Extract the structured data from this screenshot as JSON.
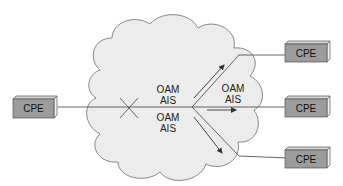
{
  "diagram": {
    "type": "network-fault-propagation",
    "cloud": {
      "fill": "#ececec",
      "stroke": "#7a7a7a"
    },
    "colors": {
      "cpe_front": "#9c9c9c",
      "cpe_top": "#d6d6d6",
      "cpe_side": "#f2f2f2",
      "line": "#555555"
    },
    "nodes": [
      {
        "id": "cpe-left",
        "label": "CPE"
      },
      {
        "id": "cpe-top-right",
        "label": "CPE"
      },
      {
        "id": "cpe-mid-right",
        "label": "CPE"
      },
      {
        "id": "cpe-bottom-right",
        "label": "CPE"
      }
    ],
    "fault_marker": {
      "symbol": "X",
      "meaning": "link failure"
    },
    "labels": [
      {
        "line1": "OAM",
        "line2": "AIS",
        "position": "upper-center"
      },
      {
        "line1": "OAM",
        "line2": "AIS",
        "position": "lower-center"
      },
      {
        "line1": "OAM",
        "line2": "AIS",
        "position": "upper-right"
      }
    ],
    "arrows": [
      {
        "direction": "up-right",
        "toward": "cpe-top-right"
      },
      {
        "direction": "right",
        "toward": "cpe-mid-right"
      },
      {
        "direction": "down-right",
        "toward": "cpe-bottom-right"
      }
    ]
  }
}
